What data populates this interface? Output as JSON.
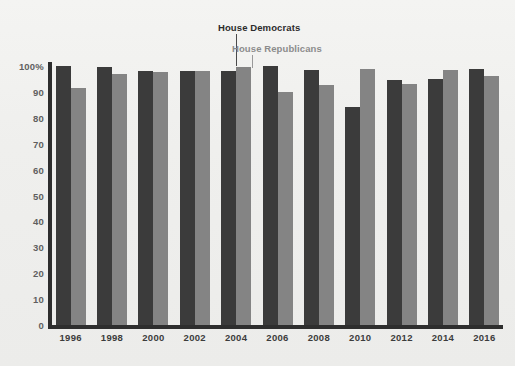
{
  "chart_data": {
    "type": "bar",
    "title": "",
    "subtitle": "",
    "xlabel": "",
    "ylabel": "",
    "ylim": [
      0,
      100
    ],
    "ytick_labels": [
      "100%",
      "90",
      "80",
      "70",
      "60",
      "50",
      "40",
      "30",
      "20",
      "10",
      "0"
    ],
    "ytick_values": [
      100,
      90,
      80,
      70,
      60,
      50,
      40,
      30,
      20,
      10,
      0
    ],
    "grid": false,
    "legend_position": "inline-annotation",
    "categories": [
      "1996",
      "1998",
      "2000",
      "2002",
      "2004",
      "2006",
      "2008",
      "2010",
      "2012",
      "2014",
      "2016"
    ],
    "series": [
      {
        "name": "House Democrats",
        "color": "#3b3b3b",
        "values": [
          100,
          99.5,
          98,
          98,
          98,
          100,
          98.5,
          84,
          94.5,
          95,
          99
        ]
      },
      {
        "name": "House Republicans",
        "color": "#848484",
        "values": [
          91.5,
          97,
          97.5,
          98,
          99.5,
          90,
          92.5,
          99,
          93,
          98.5,
          96
        ]
      }
    ],
    "annotations": [
      {
        "text": "House Democrats",
        "target_category": "2004",
        "series": "House Democrats"
      },
      {
        "text": "House Republicans",
        "target_category": "2004",
        "series": "House Republicans"
      }
    ]
  },
  "colors": {
    "background": "#f1f1ef",
    "axis": "#2e2e2e",
    "democrat": "#3b3b3b",
    "republican": "#848484",
    "ytick_text": "#5f5f5f",
    "xtick_text": "#3c3c3c"
  }
}
